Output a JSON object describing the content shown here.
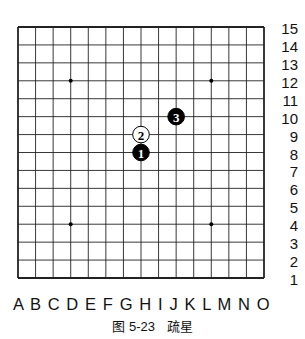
{
  "board": {
    "size": 15,
    "columns": [
      "A",
      "B",
      "C",
      "D",
      "E",
      "F",
      "G",
      "H",
      "I",
      "J",
      "K",
      "L",
      "M",
      "N",
      "O"
    ],
    "rows": [
      "15",
      "14",
      "13",
      "12",
      "11",
      "10",
      "9",
      "8",
      "7",
      "6",
      "5",
      "4",
      "3",
      "2",
      "1"
    ],
    "star_points": [
      "D12",
      "L12",
      "D4",
      "L4"
    ],
    "stones": [
      {
        "move": "1",
        "color": "black",
        "point": "H8"
      },
      {
        "move": "2",
        "color": "white",
        "point": "H9"
      },
      {
        "move": "3",
        "color": "black",
        "point": "J10"
      }
    ]
  },
  "column_labels_text": "A B C D E F G H I J K L M N O",
  "caption": {
    "figure": "图 5-23",
    "title": "疏星"
  }
}
